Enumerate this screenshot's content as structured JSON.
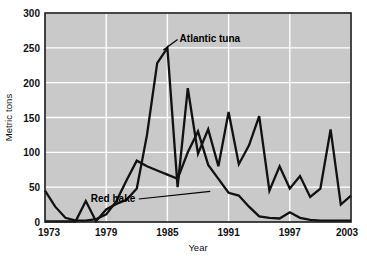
{
  "chart_data": {
    "type": "line",
    "title": "",
    "subtitle": "",
    "xlabel": "Year",
    "ylabel": "Metric tons",
    "xlim": [
      1973,
      2003
    ],
    "ylim": [
      0,
      300
    ],
    "yticks": [
      0,
      50,
      100,
      150,
      200,
      250,
      300
    ],
    "ytick_labels": [
      "0",
      "50",
      "100",
      "150",
      "200",
      "250",
      "300"
    ],
    "xticks": [
      1973,
      1979,
      1985,
      1991,
      1997,
      2003
    ],
    "xtick_labels": [
      "1973",
      "1979",
      "1985",
      "1991",
      "1997",
      "2003"
    ],
    "grid": true,
    "grid_color": "#ffffff",
    "plot_bg": "#c9c9c9",
    "legend_position": "inline-annotations",
    "line_color": "#111111",
    "x": [
      1973,
      1974,
      1975,
      1976,
      1977,
      1978,
      1979,
      1980,
      1981,
      1982,
      1983,
      1984,
      1985,
      1986,
      1987,
      1988,
      1989,
      1990,
      1991,
      1992,
      1993,
      1994,
      1995,
      1996,
      1997,
      1998,
      1999,
      2000,
      2001,
      2002,
      2003
    ],
    "series": [
      {
        "name": "Red hake",
        "values": [
          45,
          22,
          6,
          2,
          2,
          4,
          11,
          30,
          60,
          88,
          80,
          74,
          68,
          62,
          100,
          130,
          82,
          62,
          42,
          38,
          22,
          8,
          6,
          5,
          14,
          6,
          3,
          2,
          2,
          2,
          2
        ]
      },
      {
        "name": "Atlantic tuna",
        "values": [
          1,
          1,
          1,
          1,
          30,
          1,
          18,
          26,
          32,
          48,
          125,
          228,
          250,
          50,
          192,
          98,
          133,
          80,
          158,
          83,
          110,
          152,
          45,
          80,
          48,
          66,
          36,
          48,
          133,
          25,
          38
        ]
      }
    ],
    "annotations": [
      {
        "text": "Atlantic tuna",
        "x": 1986,
        "y": 262,
        "leader_to_x": 1984.6,
        "leader_to_y": 247
      },
      {
        "text": "Red hake",
        "x": 1982.2,
        "y": 33,
        "leader_to_x": 1989.2,
        "leader_to_y": 44
      }
    ]
  }
}
